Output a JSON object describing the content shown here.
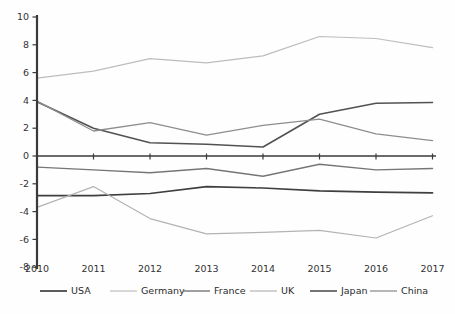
{
  "chart_data": {
    "type": "line",
    "title": "",
    "xlabel": "",
    "ylabel": "",
    "categories": [
      "2010",
      "2011",
      "2012",
      "2013",
      "2014",
      "2015",
      "2016",
      "2017"
    ],
    "series": [
      {
        "name": "USA",
        "color": "#3f3f3f",
        "width": 1.7,
        "values": [
          -2.85,
          -2.85,
          -2.7,
          -2.2,
          -2.3,
          -2.5,
          -2.6,
          -2.65
        ]
      },
      {
        "name": "Germany",
        "color": "#bdbdbd",
        "width": 1.2,
        "values": [
          5.6,
          6.1,
          7.0,
          6.7,
          7.2,
          8.6,
          8.45,
          7.8
        ]
      },
      {
        "name": "France",
        "color": "#767676",
        "width": 1.4,
        "values": [
          -0.8,
          -1.0,
          -1.2,
          -0.9,
          -1.45,
          -0.6,
          -1.0,
          -0.9
        ]
      },
      {
        "name": "UK",
        "color": "#b3b3b3",
        "width": 1.2,
        "values": [
          -3.7,
          -2.2,
          -4.5,
          -5.6,
          -5.5,
          -5.35,
          -5.9,
          -4.3
        ]
      },
      {
        "name": "Japan",
        "color": "#525252",
        "width": 1.6,
        "values": [
          3.9,
          2.0,
          0.95,
          0.85,
          0.65,
          3.0,
          3.8,
          3.85
        ]
      },
      {
        "name": "China",
        "color": "#8e8e8e",
        "width": 1.3,
        "values": [
          3.95,
          1.8,
          2.4,
          1.5,
          2.2,
          2.65,
          1.6,
          1.1
        ]
      }
    ],
    "ylim": [
      -8,
      10
    ],
    "yticks": [
      10,
      8,
      6,
      4,
      2,
      0,
      -2,
      -4,
      -6,
      -8
    ],
    "grid": false,
    "legend_position": "bottom",
    "axis_color": "#3a3a3a",
    "tick_label_color": "#333333",
    "stray_mark": {
      "x": 257,
      "y": 188
    }
  }
}
